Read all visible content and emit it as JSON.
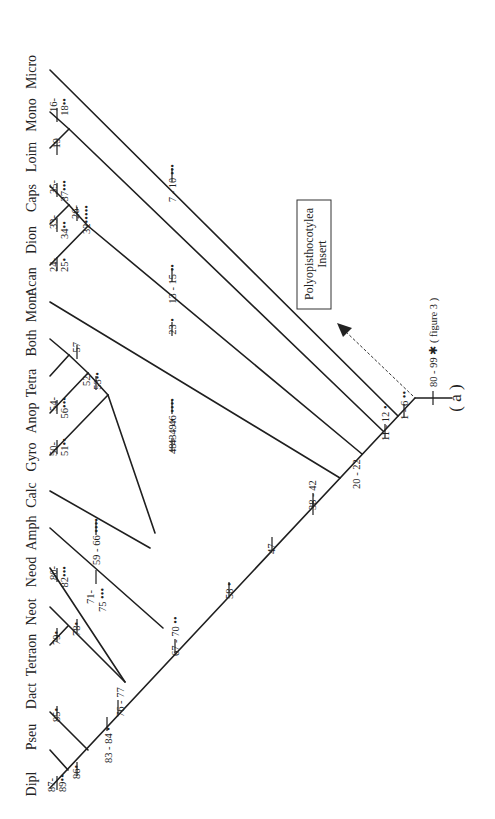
{
  "figure": {
    "panel_label": "( a )",
    "insert_box": {
      "line1": "Polyopisthocotylea",
      "line2": "Insert"
    },
    "root_label": "80 - 99 ✱ ( figure 3 )"
  },
  "taxa": [
    "Micro",
    "Mono",
    "Loim",
    "Caps",
    "Dion",
    "Acan",
    "Mont",
    "Both",
    "Tetra",
    "Anop",
    "Gyro",
    "Calc",
    "Amph",
    "Neod",
    "Neot",
    "Tetraon",
    "Dact",
    "Pseu",
    "Dipl"
  ],
  "characters": {
    "c16_18": [
      "16-",
      "18••"
    ],
    "c19": "19",
    "c35_37": [
      "35-",
      "37•••"
    ],
    "c26_32": [
      "26-",
      "32•••••"
    ],
    "c33_34": [
      "33-",
      "34••"
    ],
    "c24_25": [
      "24-",
      "25•"
    ],
    "c7_10": "7 - 10 •••",
    "c13_15": "13 - 15 ••",
    "c23": "23 •",
    "c57": "57",
    "c52_53": [
      "52-",
      "53••"
    ],
    "c54_56": [
      "54-",
      "56•••"
    ],
    "c50_51": [
      "50-",
      "51••"
    ],
    "c43_46": "43 - 46 ••••",
    "c48_49": "48 - 49 •",
    "c59_66": "59 - 66 ••••",
    "c80_82": [
      "80-",
      "82•••"
    ],
    "c71_75": [
      "71-",
      "75 •••"
    ],
    "c79": "79•",
    "c78": "78•",
    "c85": "85•",
    "c86": "86•",
    "c87_89": [
      "87-",
      "89••"
    ],
    "c83_84": "83 - 84 •",
    "c76_77": "76 - 77",
    "c67_70": "67 - 70 ••",
    "c58": "58 •",
    "c47": "47",
    "c38_42": "38 - 42",
    "c20_22": "20 - 22",
    "c11_12": "11 - 12 •",
    "c1_6": "1 - 6 ••"
  }
}
